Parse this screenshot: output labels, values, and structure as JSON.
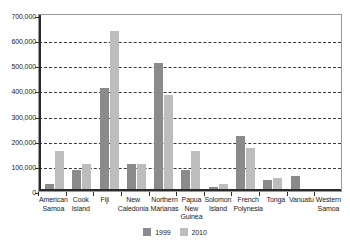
{
  "chart_data": {
    "type": "bar",
    "title": "",
    "subtitle": "",
    "xlabel": "",
    "ylabel": "",
    "ylim": [
      0,
      700000
    ],
    "ytick_step": 100000,
    "grid": true,
    "legend_position": "bottom",
    "categories": [
      "American Samoa",
      "Cook Island",
      "Fiji",
      "New Caledonia",
      "Northern Marianas",
      "Papua New Guinea",
      "Solomon Island",
      "French Polynesia",
      "Tonga",
      "Vanuatu",
      "Western Samoa"
    ],
    "category_lines": [
      [
        "American",
        "Samoa"
      ],
      [
        "Cook",
        "Island"
      ],
      [
        "Fiji"
      ],
      [
        "New",
        "Caledonia"
      ],
      [
        "Northern",
        "Marianas"
      ],
      [
        "Papua",
        "New",
        "Guinea"
      ],
      [
        "Solomon",
        "Island"
      ],
      [
        "French",
        "Polynesia"
      ],
      [
        "Tonga"
      ],
      [
        "Vanuatu"
      ],
      [
        "Western",
        "Samoa"
      ]
    ],
    "ytick_labels": [
      "700,000",
      "600,000",
      "500,000",
      "400,000",
      "300,000",
      "200,000",
      "100,000",
      "0"
    ],
    "ytick_values": [
      700000,
      600000,
      500000,
      400000,
      300000,
      200000,
      100000,
      0
    ],
    "series": [
      {
        "name": "1999",
        "color": "#8b8b8b",
        "values": [
          20000,
          75000,
          400000,
          100000,
          500000,
          75000,
          10000,
          210000,
          35000,
          50000,
          0
        ]
      },
      {
        "name": "2010",
        "color": "#bdbdbd",
        "values": [
          150000,
          100000,
          630000,
          100000,
          375000,
          150000,
          20000,
          165000,
          45000,
          0,
          0
        ]
      }
    ]
  },
  "legend": {
    "items": [
      {
        "label": "1999",
        "color": "#8b8b8b"
      },
      {
        "label": "2010",
        "color": "#bdbdbd"
      }
    ]
  },
  "colors": {
    "series_1999": "#8b8b8b",
    "series_2010": "#bdbdbd",
    "axis": "#2b2b2b",
    "grid": "#3a3a3a",
    "plot_background": "#ffffff",
    "plot_border": "#9a9a9a"
  }
}
